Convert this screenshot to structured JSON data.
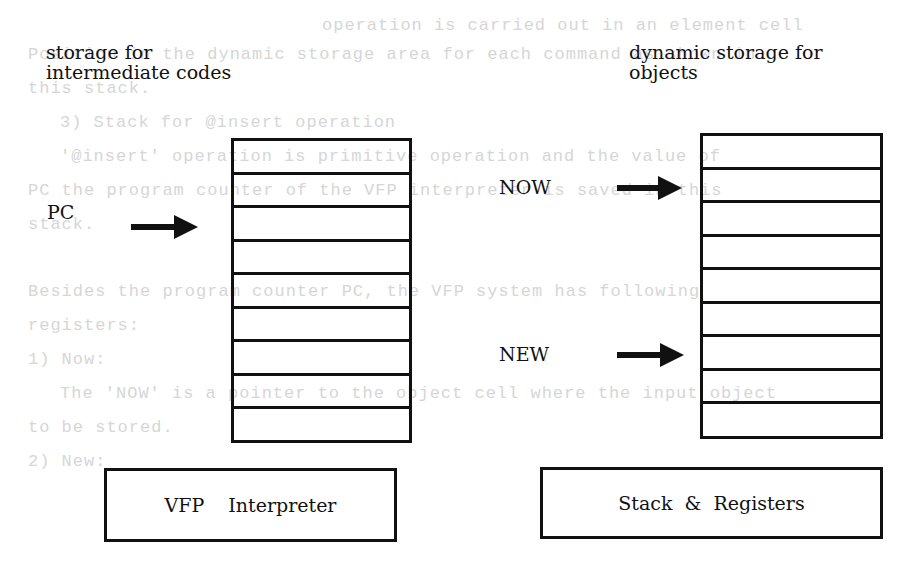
{
  "diagram": {
    "left_title_lines": [
      "storage for",
      "intermediate codes"
    ],
    "right_title_lines": [
      "dynamic storage for",
      "objects"
    ],
    "left_stack": {
      "cell_count": 9
    },
    "right_stack": {
      "cell_count": 9
    },
    "pointers": {
      "pc": "PC",
      "now": "NOW",
      "new": "NEW"
    },
    "boxes": {
      "interpreter": "VFP  Interpreter",
      "stack_registers": "Stack & Registers"
    }
  },
  "bleed_through_text": [
    "operation is carried out in an element cell",
    "Position in the dynamic storage area for each command as shown in",
    "this stack.",
    "3) Stack for @insert operation",
    "'@insert' operation is primitive operation and the value of",
    "PC the program counter of the VFP interpreter is saved in this",
    "stack.",
    "Besides the program counter PC, the VFP system has following",
    "registers:",
    "1) Now:",
    "The 'NOW' is a pointer to the object cell where the input object",
    "to be stored.",
    "2) New:"
  ]
}
